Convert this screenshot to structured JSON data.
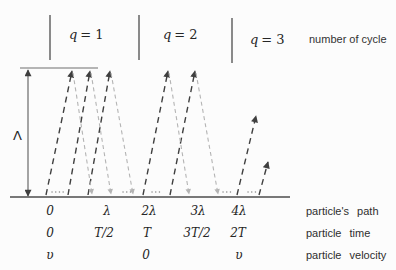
{
  "colors": {
    "ascent": "#3f3f3f",
    "descent": "#b4b4b4",
    "axis": "#4d4d4d",
    "separator": "#5a5a5a",
    "ceiling": "#6e6e6e",
    "dots": "#8c8c8c"
  },
  "header": {
    "cycles": [
      {
        "symbol": "q",
        "eq": "= 1"
      },
      {
        "symbol": "q",
        "eq": "= 2"
      },
      {
        "symbol": "q",
        "eq": "= 3"
      }
    ],
    "caption": "number of cycle"
  },
  "amplitude": {
    "symbol": "Λ"
  },
  "axis_rows": {
    "path": {
      "values": [
        "0",
        "λ",
        "2λ",
        "3λ",
        "4λ"
      ],
      "label": "particle's path"
    },
    "time": {
      "values": [
        "0",
        "T/2",
        "T",
        "3T/2",
        "2T"
      ],
      "label": "particle time"
    },
    "velocity": {
      "values": [
        "υ",
        "0",
        "υ"
      ],
      "label": "particle velocity"
    }
  }
}
